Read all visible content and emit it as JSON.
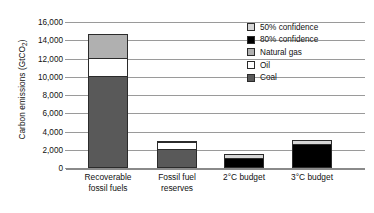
{
  "chart_data": {
    "type": "bar",
    "subtype": "stacked",
    "title": "",
    "xlabel": "",
    "ylabel": "Carbon emissions (GtCO2)",
    "ylabel_main": "Carbon emissions (GtCO",
    "ylabel_sub": "2",
    "ylabel_end": ")",
    "ylim": [
      0,
      16000
    ],
    "ytick_step": 2000,
    "grid": true,
    "legend_position": "top-right",
    "categories": [
      "Recoverable fossil fuels",
      "Fossil fuel reserves",
      "2°C budget",
      "3°C budget"
    ],
    "category_lines": [
      [
        "Recoverable",
        "fossil fuels"
      ],
      [
        "Fossil fuel",
        "reserves"
      ],
      [
        "2°C budget",
        ""
      ],
      [
        "3°C budget",
        ""
      ]
    ],
    "ytick_labels": [
      "16,000",
      "14,000",
      "12,000",
      "10,000",
      "8,000",
      "6,000",
      "4,000",
      "2,000",
      "0"
    ],
    "ytick_values": [
      16000,
      14000,
      12000,
      10000,
      8000,
      6000,
      4000,
      2000,
      0
    ],
    "series": [
      {
        "name": "Coal",
        "color": "#595959",
        "values": [
          10000,
          2000,
          0,
          0
        ]
      },
      {
        "name": "Oil",
        "color": "#ffffff",
        "values": [
          2000,
          850,
          0,
          0
        ]
      },
      {
        "name": "Natural gas",
        "color": "#b0b0b0",
        "values": [
          2700,
          150,
          0,
          0
        ]
      },
      {
        "name": "80% confidence",
        "color": "#000000",
        "values": [
          0,
          0,
          1050,
          2600
        ]
      },
      {
        "name": "50% confidence",
        "color": "#d6d6d6",
        "values": [
          0,
          0,
          450,
          500
        ]
      }
    ],
    "bar_totals": [
      14700,
      3000,
      1500,
      3100
    ],
    "legend": [
      {
        "label": "50% confidence",
        "color": "#d6d6d6"
      },
      {
        "label": "80% confidence",
        "color": "#000000"
      },
      {
        "label": "Natural gas",
        "color": "#b0b0b0"
      },
      {
        "label": "Oil",
        "color": "#ffffff"
      },
      {
        "label": "Coal",
        "color": "#595959"
      }
    ]
  }
}
